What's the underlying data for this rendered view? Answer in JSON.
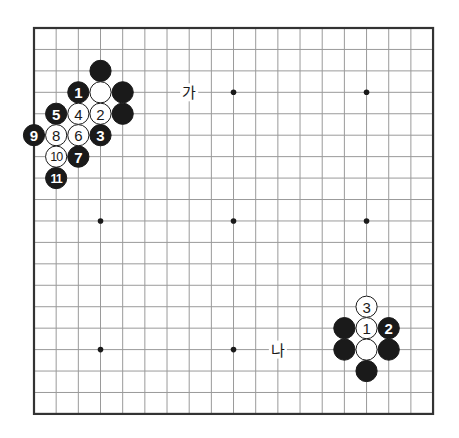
{
  "board": {
    "size": 19,
    "origin_px": {
      "x": 34,
      "y": 28
    },
    "spacing_px": {
      "x": 22.17,
      "y": 21.44
    },
    "colors": {
      "grid_line": "#9a9a9a",
      "border": "#333333",
      "black_stone": "#1a1a1a",
      "white_stone": "#ffffff"
    },
    "star_points": [
      {
        "col": 3,
        "row": 3
      },
      {
        "col": 9,
        "row": 3
      },
      {
        "col": 15,
        "row": 3
      },
      {
        "col": 3,
        "row": 9
      },
      {
        "col": 9,
        "row": 9
      },
      {
        "col": 15,
        "row": 9
      },
      {
        "col": 3,
        "row": 15
      },
      {
        "col": 9,
        "row": 15
      },
      {
        "col": 15,
        "row": 15
      }
    ]
  },
  "stones": [
    {
      "col": 3,
      "row": 2,
      "color": "black",
      "label": ""
    },
    {
      "col": 2,
      "row": 3,
      "color": "black",
      "label": "1"
    },
    {
      "col": 3,
      "row": 3,
      "color": "white",
      "label": ""
    },
    {
      "col": 4,
      "row": 3,
      "color": "black",
      "label": ""
    },
    {
      "col": 1,
      "row": 4,
      "color": "black",
      "label": "5"
    },
    {
      "col": 2,
      "row": 4,
      "color": "white",
      "label": "4"
    },
    {
      "col": 3,
      "row": 4,
      "color": "white",
      "label": "2"
    },
    {
      "col": 4,
      "row": 4,
      "color": "black",
      "label": ""
    },
    {
      "col": 0,
      "row": 5,
      "color": "black",
      "label": "9"
    },
    {
      "col": 1,
      "row": 5,
      "color": "white",
      "label": "8"
    },
    {
      "col": 2,
      "row": 5,
      "color": "white",
      "label": "6"
    },
    {
      "col": 3,
      "row": 5,
      "color": "black",
      "label": "3"
    },
    {
      "col": 1,
      "row": 6,
      "color": "white",
      "label": "10"
    },
    {
      "col": 2,
      "row": 6,
      "color": "black",
      "label": "7"
    },
    {
      "col": 1,
      "row": 7,
      "color": "black",
      "label": "11"
    },
    {
      "col": 15,
      "row": 13,
      "color": "white",
      "label": "3"
    },
    {
      "col": 14,
      "row": 14,
      "color": "black",
      "label": ""
    },
    {
      "col": 15,
      "row": 14,
      "color": "white",
      "label": "1"
    },
    {
      "col": 16,
      "row": 14,
      "color": "black",
      "label": "2"
    },
    {
      "col": 14,
      "row": 15,
      "color": "black",
      "label": ""
    },
    {
      "col": 15,
      "row": 15,
      "color": "white",
      "label": ""
    },
    {
      "col": 16,
      "row": 15,
      "color": "black",
      "label": ""
    },
    {
      "col": 15,
      "row": 16,
      "color": "black",
      "label": ""
    }
  ],
  "labels": [
    {
      "col": 7,
      "row": 3,
      "text": "가"
    },
    {
      "col": 11,
      "row": 15,
      "text": "나"
    }
  ]
}
